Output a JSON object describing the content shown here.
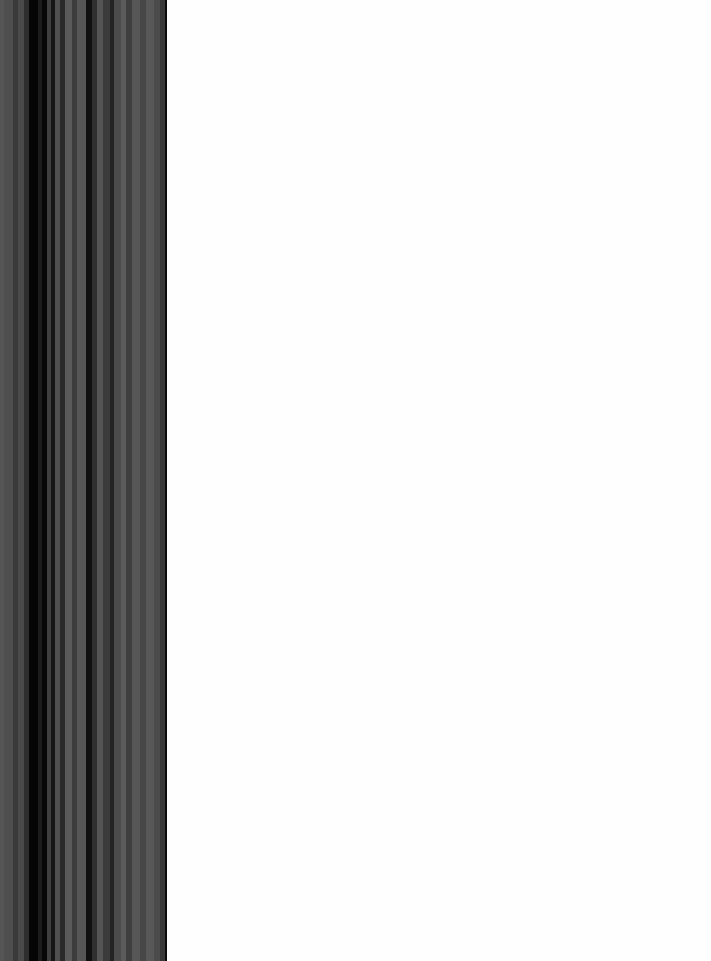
{
  "window": {
    "title": "",
    "background_color": "#ffffff"
  },
  "striped_panel": {
    "name": "striped-panel",
    "x": 0,
    "y": 0,
    "width": 167,
    "height": 961,
    "base_color": "#4d4d4d",
    "edge_color": "#0d0d0d",
    "edge_x": 165,
    "stripes": [
      {
        "x": 0,
        "width": 4,
        "color": "#555555"
      },
      {
        "x": 4,
        "width": 9,
        "color": "#4e4e4e"
      },
      {
        "x": 13,
        "width": 5,
        "color": "#3a3a3a"
      },
      {
        "x": 18,
        "width": 6,
        "color": "#4a4a4a"
      },
      {
        "x": 24,
        "width": 5,
        "color": "#2e2e2e"
      },
      {
        "x": 29,
        "width": 9,
        "color": "#050505"
      },
      {
        "x": 38,
        "width": 4,
        "color": "#1c1c1c"
      },
      {
        "x": 42,
        "width": 5,
        "color": "#070707"
      },
      {
        "x": 47,
        "width": 4,
        "color": "#3f3f3f"
      },
      {
        "x": 51,
        "width": 4,
        "color": "#161616"
      },
      {
        "x": 55,
        "width": 5,
        "color": "#4f4f4f"
      },
      {
        "x": 60,
        "width": 5,
        "color": "#2a2a2a"
      },
      {
        "x": 65,
        "width": 7,
        "color": "#5a5a5a"
      },
      {
        "x": 72,
        "width": 5,
        "color": "#3c3c3c"
      },
      {
        "x": 77,
        "width": 9,
        "color": "#565656"
      },
      {
        "x": 86,
        "width": 6,
        "color": "#101010"
      },
      {
        "x": 92,
        "width": 5,
        "color": "#2f2f2f"
      },
      {
        "x": 97,
        "width": 6,
        "color": "#545454"
      },
      {
        "x": 103,
        "width": 7,
        "color": "#3b3b3b"
      },
      {
        "x": 110,
        "width": 4,
        "color": "#232323"
      },
      {
        "x": 114,
        "width": 7,
        "color": "#4c4c4c"
      },
      {
        "x": 121,
        "width": 5,
        "color": "#5b5b5b"
      },
      {
        "x": 126,
        "width": 6,
        "color": "#3e3e3e"
      },
      {
        "x": 132,
        "width": 8,
        "color": "#565656"
      },
      {
        "x": 140,
        "width": 6,
        "color": "#474747"
      },
      {
        "x": 146,
        "width": 8,
        "color": "#585858"
      },
      {
        "x": 154,
        "width": 6,
        "color": "#4b4b4b"
      },
      {
        "x": 160,
        "width": 5,
        "color": "#3a3a3a"
      }
    ]
  },
  "blank_canvas": {
    "name": "blank-canvas",
    "x": 167,
    "y": 0,
    "width": 544,
    "height": 961,
    "color": "#fefefe",
    "content": ""
  }
}
